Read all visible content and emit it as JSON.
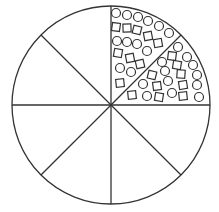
{
  "diagram": {
    "type": "sector-circle",
    "center": [
      111,
      105
    ],
    "radius": 99,
    "sector_count": 8,
    "stroke_color": "#333333",
    "background": "#ffffff",
    "filled_sectors": [
      "upper-right-top",
      "upper-right-bottom"
    ],
    "shape_size": 9,
    "shapes": [
      {
        "kind": "circle",
        "x": 116,
        "y": 13
      },
      {
        "kind": "circle",
        "x": 127,
        "y": 15
      },
      {
        "kind": "circle",
        "x": 138,
        "y": 17
      },
      {
        "kind": "circle",
        "x": 148,
        "y": 21
      },
      {
        "kind": "circle",
        "x": 159,
        "y": 26
      },
      {
        "kind": "circle",
        "x": 169,
        "y": 33
      },
      {
        "kind": "square",
        "x": 116,
        "y": 27
      },
      {
        "kind": "square",
        "x": 127,
        "y": 28
      },
      {
        "kind": "square",
        "x": 137,
        "y": 30
      },
      {
        "kind": "square",
        "x": 148,
        "y": 36
      },
      {
        "kind": "square",
        "x": 158,
        "y": 43
      },
      {
        "kind": "circle",
        "x": 117,
        "y": 41
      },
      {
        "kind": "circle",
        "x": 127,
        "y": 42
      },
      {
        "kind": "circle",
        "x": 137,
        "y": 44
      },
      {
        "kind": "circle",
        "x": 147,
        "y": 51
      },
      {
        "kind": "square",
        "x": 118,
        "y": 53
      },
      {
        "kind": "square",
        "x": 130,
        "y": 58
      },
      {
        "kind": "square",
        "x": 140,
        "y": 64
      },
      {
        "kind": "circle",
        "x": 120,
        "y": 68
      },
      {
        "kind": "circle",
        "x": 131,
        "y": 72
      },
      {
        "kind": "square",
        "x": 120,
        "y": 83
      },
      {
        "kind": "circle",
        "x": 178,
        "y": 47
      },
      {
        "kind": "circle",
        "x": 187,
        "y": 57
      },
      {
        "kind": "circle",
        "x": 193,
        "y": 65
      },
      {
        "kind": "circle",
        "x": 197,
        "y": 75
      },
      {
        "kind": "circle",
        "x": 197,
        "y": 85
      },
      {
        "kind": "circle",
        "x": 199,
        "y": 97
      },
      {
        "kind": "square",
        "x": 172,
        "y": 56
      },
      {
        "kind": "square",
        "x": 177,
        "y": 65
      },
      {
        "kind": "square",
        "x": 181,
        "y": 74
      },
      {
        "kind": "square",
        "x": 183,
        "y": 85
      },
      {
        "kind": "square",
        "x": 183,
        "y": 96
      },
      {
        "kind": "circle",
        "x": 162,
        "y": 62
      },
      {
        "kind": "circle",
        "x": 165,
        "y": 71
      },
      {
        "kind": "circle",
        "x": 168,
        "y": 81
      },
      {
        "kind": "circle",
        "x": 172,
        "y": 93
      },
      {
        "kind": "square",
        "x": 152,
        "y": 75
      },
      {
        "kind": "square",
        "x": 157,
        "y": 86
      },
      {
        "kind": "square",
        "x": 159,
        "y": 97
      },
      {
        "kind": "circle",
        "x": 143,
        "y": 84
      },
      {
        "kind": "circle",
        "x": 147,
        "y": 96
      },
      {
        "kind": "square",
        "x": 132,
        "y": 95
      }
    ],
    "counts": {
      "upper_sector": {
        "circles": 12,
        "squares": 9
      },
      "lower_sector": {
        "circles": 12,
        "squares": 9
      }
    }
  }
}
